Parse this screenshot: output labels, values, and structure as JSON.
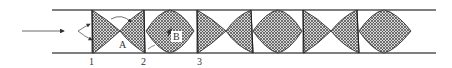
{
  "diagram": {
    "type": "flow-in-pipe-cell-structure",
    "pipe": {
      "x_start": 52,
      "x_end": 436,
      "y_top": 10,
      "y_bottom": 53,
      "color": "#555555"
    },
    "flow_arrow": {
      "x1": 22,
      "x2": 66,
      "y": 31,
      "direction": "right"
    },
    "colors": {
      "hatch": "#444444",
      "fill_bg": "#cccccc",
      "outline": "#333333"
    },
    "station_labels": [
      {
        "text": "1",
        "x": 92
      },
      {
        "text": "2",
        "x": 141
      },
      {
        "text": "3",
        "x": 200
      }
    ],
    "region_labels": [
      {
        "text": "A",
        "x": 120,
        "y": 42
      },
      {
        "text": "B",
        "x": 177,
        "y": 35
      }
    ],
    "cells": [
      "tapered-left",
      "tapered-right",
      "lens",
      "tapered-left",
      "tapered-right",
      "lens",
      "tapered-left",
      "tapered-right",
      "lens"
    ]
  }
}
